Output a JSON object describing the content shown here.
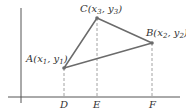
{
  "diagram": {
    "colors": {
      "line": "#6b6b6b",
      "axis": "#555555",
      "dash": "#8a8a8a",
      "point": "#6b6b6b"
    },
    "points": {
      "A": {
        "name": "A",
        "x_sub": "1",
        "y_sub": "1"
      },
      "B": {
        "name": "B",
        "x_sub": "2",
        "y_sub": "2"
      },
      "C": {
        "name": "C",
        "x_sub": "3",
        "y_sub": "3"
      }
    },
    "axis_labels": {
      "D": "D",
      "E": "E",
      "F": "F"
    }
  }
}
